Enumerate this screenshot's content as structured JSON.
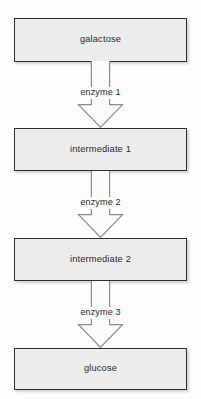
{
  "diagram": {
    "type": "flowchart",
    "background_color": "#fdfdfd",
    "node_fill_color": "#ececec",
    "node_border_color": "#2e2e2e",
    "arrow_fill_color": "#fbfbfb",
    "arrow_stroke_color": "#8c8c8c",
    "text_color": "#2b2b2b",
    "nodes": [
      {
        "id": "galactose",
        "label": "galactose"
      },
      {
        "id": "intermediate-1",
        "label": "intermediate 1"
      },
      {
        "id": "intermediate-2",
        "label": "intermediate 2"
      },
      {
        "id": "glucose",
        "label": "glucose"
      }
    ],
    "arrows": [
      {
        "id": "arrow-1",
        "label": "enzyme 1",
        "from": "galactose",
        "to": "intermediate-1"
      },
      {
        "id": "arrow-2",
        "label": "enzyme 2",
        "from": "intermediate-1",
        "to": "intermediate-2"
      },
      {
        "id": "arrow-3",
        "label": "enzyme 3",
        "from": "intermediate-2",
        "to": "glucose"
      }
    ]
  }
}
